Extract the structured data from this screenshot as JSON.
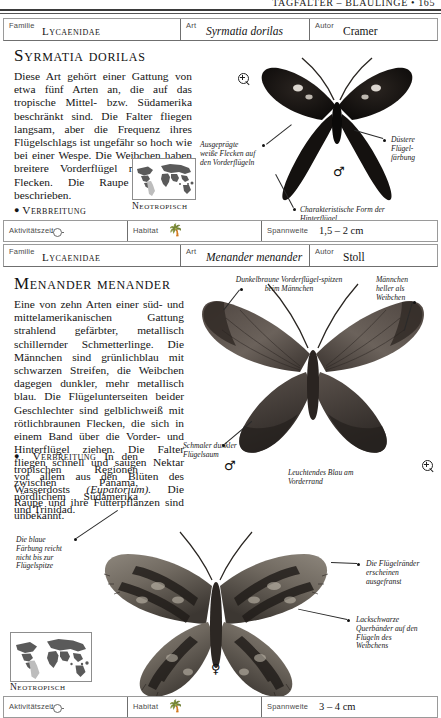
{
  "running_head": "TAGFALTER – BLÄULINGE • 165",
  "entries": [
    {
      "header": {
        "familie_key": "Familie",
        "familie_value": "Lycaenidae",
        "art_key": "Art",
        "art_value": "Syrmatia dorilas",
        "autor_key": "Autor",
        "autor_value": "Cramer"
      },
      "title": "Syrmatia dorilas",
      "body_paragraph": "Diese Art gehört einer Gattung von etwa fünf Arten an, die auf das tropische Mittel- bzw. Südamerika beschränkt sind. Die Falter fliegen langsam, aber die Frequenz ihres Flügelschlags ist ungefähr so hoch wie bei einer Wespe. Die Weibchen haben breitere Vorderflügel mit orangen Flecken. Die Raupe ist nicht beschrieben.",
      "verbreitung_label": "Verbreitung",
      "verbreitung_text": "Brasilien und Venezuela.",
      "map_label": "Neotropisch",
      "gender_symbol": "♂",
      "annotations": [
        "Ausgeprägte weiße Flecken auf den Vorderflügeln",
        "Düstere Flügel-färbung",
        "Charakteristische Form der Hinterflügel"
      ],
      "footer": {
        "aktivitaet_key": "Aktivitätszeit",
        "aktivitaet_icon": "sun-icon",
        "habitat_key": "Habitat",
        "habitat_icon": "tree-icon",
        "spannweite_key": "Spannweite",
        "spannweite_value": "1,5 – 2 cm"
      }
    },
    {
      "header": {
        "familie_key": "Familie",
        "familie_value": "Lycaenidae",
        "art_key": "Art",
        "art_value": "Menander menander",
        "autor_key": "Autor",
        "autor_value": "Stoll"
      },
      "title": "Menander menander",
      "body_paragraph": "Eine von zehn Arten einer süd- und mittelamerikanischen Gattung strahlend gefärbter, metallisch schillernder Schmetterlinge. Die Männchen sind grünlichblau mit schwarzen Streifen, die Weibchen dagegen dunkler, mehr metallisch blau. Die Flügelunterseiten beider Geschlechter sind gelblichweiß mit rötlichbraunen Flecken, die sich in einem Band über die Vorder- und Hinterflügel ziehen. Die Falter fliegen schnell und saugen Nektar vor allem aus den Blüten des Wasserdosts",
      "body_italic": "(Eupatorium).",
      "body_tail": "Die Raupe und ihre Futterpflanzen sind unbekannt.",
      "verbreitung_label": "Verbreitung",
      "verbreitung_text": "In den tropischen Regionen zwischen Panama, nördlichem Südamerika und Trinidad.",
      "map_label": "Neotropisch",
      "gender_symbol_male": "♂",
      "gender_symbol_female": "♀",
      "annotations": [
        "Dunkelbraune Vorderflügel-spitzen beim Männchen",
        "Männchen heller als Weibchen",
        "Schmaler dunkler Flügelsaum",
        "Leuchtendes Blau am Vorderrand",
        "Die blaue Färbung reicht nicht bis zur Flügelspitze",
        "Die Flügelränder erscheinen ausgefranst",
        "Lackschwarze Querbänder auf den Flügeln des Weibchens"
      ],
      "footer": {
        "aktivitaet_key": "Aktivitätszeit",
        "aktivitaet_icon": "sun-icon",
        "habitat_key": "Habitat",
        "habitat_icon": "tree-icon",
        "spannweite_key": "Spannweite",
        "spannweite_value": "3 – 4 cm"
      }
    }
  ]
}
